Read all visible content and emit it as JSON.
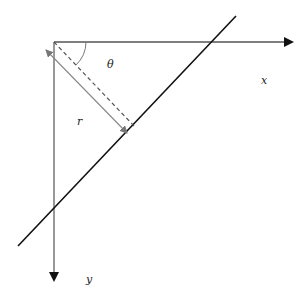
{
  "diagram": {
    "type": "geometry",
    "labels": {
      "x_axis": "x",
      "y_axis": "y",
      "angle": "θ",
      "distance": "r"
    },
    "colors": {
      "axis": "#555555",
      "line": "#111111",
      "perpendicular": "#555555",
      "arrow_double": "#777777"
    }
  }
}
